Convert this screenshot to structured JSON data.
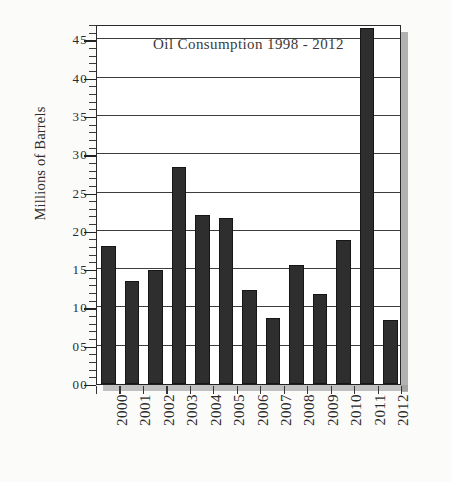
{
  "chart_data": {
    "type": "bar",
    "title": "Oil Consumption 1998 - 2012",
    "xlabel": "",
    "ylabel": "Millions of Barrels",
    "categories": [
      "2000",
      "2001",
      "2002",
      "2003",
      "2004",
      "2005",
      "2006",
      "2007",
      "2008",
      "2009",
      "2010",
      "2011",
      "2012"
    ],
    "values": [
      18.0,
      13.5,
      14.9,
      28.3,
      22.1,
      21.7,
      12.3,
      8.6,
      15.5,
      11.8,
      18.8,
      46.5,
      8.4
    ],
    "ylim": [
      0,
      47
    ],
    "ytick_values": [
      0,
      5,
      10,
      15,
      20,
      25,
      30,
      35,
      40,
      45
    ],
    "ytick_labels": [
      "00",
      "05",
      "10",
      "15",
      "20",
      "25",
      "30",
      "35",
      "40",
      "45"
    ],
    "yminor_step": 1,
    "grid": true,
    "grid_axis": "y",
    "legend": null,
    "legend_position": "none",
    "bar_color": "#2e2e2e",
    "series": [
      {
        "name": "Oil Consumption",
        "values": [
          18.0,
          13.5,
          14.9,
          28.3,
          22.1,
          21.7,
          12.3,
          8.6,
          15.5,
          11.8,
          18.8,
          46.5,
          8.4
        ]
      }
    ]
  },
  "style": {
    "background": "#fbfbfa",
    "plot_background": "#ffffff",
    "axis_color": "#2a2a2a",
    "grid_color": "#3d3d3d",
    "text_color": "#2b2b2b",
    "shadow_color": "#9a9a9a"
  }
}
